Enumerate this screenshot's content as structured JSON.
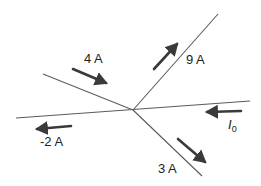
{
  "diagram": {
    "junction": {
      "x": 133,
      "y": 110
    },
    "wires": [
      {
        "name": "upper-left",
        "x1": 43,
        "y1": 74,
        "x2": 133,
        "y2": 110
      },
      {
        "name": "upper-right",
        "x1": 133,
        "y1": 110,
        "x2": 218,
        "y2": 14
      },
      {
        "name": "horizontal",
        "x1": 16,
        "y1": 118,
        "x2": 250,
        "y2": 101
      },
      {
        "name": "lower-right",
        "x1": 133,
        "y1": 110,
        "x2": 202,
        "y2": 176
      }
    ],
    "currents": [
      {
        "label": "4 A",
        "direction": "into junction",
        "arrow": {
          "x1": 73,
          "y1": 69,
          "x2": 106,
          "y2": 83
        },
        "label_pos": {
          "x": 84,
          "y": 51
        }
      },
      {
        "label": "9 A",
        "direction": "out of junction",
        "arrow": {
          "x1": 153,
          "y1": 69,
          "x2": 177,
          "y2": 44
        },
        "label_pos": {
          "x": 186,
          "y": 52
        }
      },
      {
        "label": "-2 A",
        "direction": "out of junction",
        "arrow": {
          "x1": 71,
          "y1": 126,
          "x2": 37,
          "y2": 129
        },
        "label_pos": {
          "x": 40,
          "y": 134
        }
      },
      {
        "label": "I",
        "subscript": "0",
        "direction": "into junction",
        "arrow": {
          "x1": 241,
          "y1": 112,
          "x2": 207,
          "y2": 113
        },
        "label_pos": {
          "x": 227,
          "y": 118
        }
      },
      {
        "label": "3 A",
        "direction": "out of junction",
        "arrow": {
          "x1": 178,
          "y1": 139,
          "x2": 204,
          "y2": 161
        },
        "label_pos": {
          "x": 158,
          "y": 161
        }
      }
    ]
  },
  "labels": {
    "current_4": "4 A",
    "current_9": "9 A",
    "current_neg2": "-2 A",
    "current_i0_symbol": "I",
    "current_i0_sub": "0",
    "current_3": "3 A"
  },
  "colors": {
    "wire": "#5a5a5a",
    "arrow": "#3a3a3a",
    "text": "#222222",
    "background": "#ffffff"
  }
}
